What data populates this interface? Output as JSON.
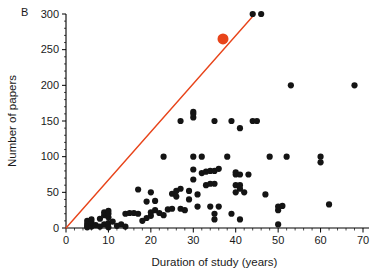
{
  "panel": {
    "label": "B"
  },
  "colors": {
    "point": "#141414",
    "highlight": "#E8441A",
    "line": "#E8441A",
    "axis": "#000000",
    "text": "#1a1a1a",
    "background": "#ffffff"
  },
  "chart_data": {
    "type": "scatter",
    "title": "",
    "xlabel": "Duration of study (years)",
    "ylabel": "Number of papers",
    "xlim": [
      0,
      70
    ],
    "ylim": [
      0,
      300
    ],
    "xticks": [
      0,
      10,
      20,
      30,
      40,
      50,
      60,
      70
    ],
    "yticks": [
      0,
      50,
      100,
      150,
      200,
      250,
      300
    ],
    "xtick_labels": [
      "0",
      "10",
      "20",
      "30",
      "40",
      "50",
      "60",
      "70"
    ],
    "ytick_labels": [
      "0",
      "50",
      "100",
      "150",
      "200",
      "250",
      "300"
    ],
    "x_minor_interval": 2,
    "y_minor_interval": 10,
    "grid": false,
    "legend": null,
    "series": [
      {
        "name": "studies",
        "marker": "circle",
        "color": "#141414",
        "points": [
          [
            5,
            1
          ],
          [
            5,
            3
          ],
          [
            5,
            6
          ],
          [
            5,
            10
          ],
          [
            6,
            2
          ],
          [
            6,
            8
          ],
          [
            6,
            12
          ],
          [
            7,
            4
          ],
          [
            8,
            2
          ],
          [
            8,
            13
          ],
          [
            9,
            5
          ],
          [
            9,
            18
          ],
          [
            9,
            22
          ],
          [
            10,
            7
          ],
          [
            10,
            15
          ],
          [
            10,
            20
          ],
          [
            10,
            24
          ],
          [
            10,
            1
          ],
          [
            11,
            9
          ],
          [
            12,
            3
          ],
          [
            13,
            5
          ],
          [
            14,
            2
          ],
          [
            14,
            20
          ],
          [
            15,
            21
          ],
          [
            16,
            21
          ],
          [
            17,
            20
          ],
          [
            17,
            54
          ],
          [
            18,
            10
          ],
          [
            19,
            14
          ],
          [
            19,
            37
          ],
          [
            20,
            17
          ],
          [
            20,
            50
          ],
          [
            20,
            22
          ],
          [
            21,
            25
          ],
          [
            21,
            38
          ],
          [
            22,
            21
          ],
          [
            23,
            18
          ],
          [
            23,
            100
          ],
          [
            24,
            26
          ],
          [
            25,
            27
          ],
          [
            25,
            48
          ],
          [
            26,
            44
          ],
          [
            26,
            52
          ],
          [
            27,
            27
          ],
          [
            27,
            150
          ],
          [
            27,
            55
          ],
          [
            28,
            25
          ],
          [
            29,
            40
          ],
          [
            29,
            52
          ],
          [
            30,
            68
          ],
          [
            30,
            82
          ],
          [
            30,
            155
          ],
          [
            30,
            160
          ],
          [
            30,
            163
          ],
          [
            30,
            100
          ],
          [
            31,
            47
          ],
          [
            31,
            30
          ],
          [
            32,
            77
          ],
          [
            32,
            100
          ],
          [
            33,
            79
          ],
          [
            33,
            60
          ],
          [
            34,
            30
          ],
          [
            34,
            62
          ],
          [
            34,
            80
          ],
          [
            35,
            12
          ],
          [
            35,
            20
          ],
          [
            35,
            62
          ],
          [
            35,
            80
          ],
          [
            35,
            150
          ],
          [
            36,
            30
          ],
          [
            36,
            83
          ],
          [
            37,
            265
          ],
          [
            38,
            100
          ],
          [
            39,
            20
          ],
          [
            39,
            150
          ],
          [
            40,
            60
          ],
          [
            40,
            75
          ],
          [
            40,
            78
          ],
          [
            40,
            50
          ],
          [
            41,
            12
          ],
          [
            41,
            55
          ],
          [
            41,
            60
          ],
          [
            41,
            75
          ],
          [
            41,
            140
          ],
          [
            42,
            50
          ],
          [
            43,
            75
          ],
          [
            44,
            300
          ],
          [
            44,
            150
          ],
          [
            45,
            150
          ],
          [
            46,
            300
          ],
          [
            47,
            47
          ],
          [
            48,
            100
          ],
          [
            50,
            5
          ],
          [
            50,
            25
          ],
          [
            50,
            30
          ],
          [
            51,
            31
          ],
          [
            52,
            100
          ],
          [
            53,
            200
          ],
          [
            60,
            92
          ],
          [
            60,
            100
          ],
          [
            62,
            33
          ],
          [
            68,
            200
          ]
        ]
      }
    ],
    "highlight_point": {
      "x": 37,
      "y": 265,
      "color": "#E8441A",
      "size": 5.5
    },
    "reference_line": {
      "type": "line",
      "color": "#E8441A",
      "from": [
        0,
        0
      ],
      "to": [
        44.5,
        300
      ],
      "slope_papers_per_year": 6.74,
      "width": 1.4
    }
  }
}
